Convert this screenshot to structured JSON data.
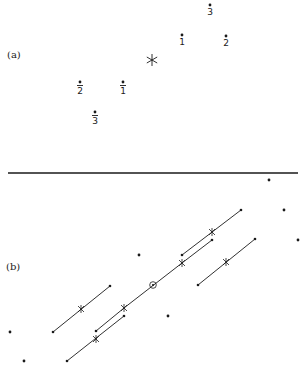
{
  "figure": {
    "panels": [
      {
        "label": "(a)",
        "label_pos": [
          7,
          57
        ],
        "center_marker": {
          "symbol": "asterisk",
          "pos": [
            152,
            60
          ]
        },
        "points": [
          {
            "label": "1",
            "bar": false,
            "pos": [
              182,
              40
            ]
          },
          {
            "label": "2",
            "bar": false,
            "pos": [
              226,
              41
            ]
          },
          {
            "label": "3",
            "bar": false,
            "pos": [
              210,
              10
            ]
          },
          {
            "label": "1",
            "bar": true,
            "pos": [
              123,
              88
            ]
          },
          {
            "label": "2",
            "bar": true,
            "pos": [
              80,
              88
            ]
          },
          {
            "label": "3",
            "bar": true,
            "pos": [
              95,
              118
            ]
          }
        ]
      },
      {
        "label": "(b)",
        "label_pos": [
          6,
          269
        ],
        "center_marker": {
          "symbol": "circled-dot",
          "pos": [
            153,
            285
          ]
        },
        "isolated_points": [
          [
            269,
            180
          ],
          [
            284,
            210
          ],
          [
            298,
            240
          ],
          [
            139,
            255
          ],
          [
            168,
            316
          ],
          [
            10,
            332
          ],
          [
            24,
            361
          ]
        ],
        "segments": [
          {
            "name": "main-line",
            "from": [
              124,
              308
            ],
            "to": [
              182,
              263
            ],
            "ends": "crosses"
          },
          {
            "name": "upper-branch",
            "from": [
              182,
              263
            ],
            "to": [
              212,
              240
            ],
            "end_dot": true
          },
          {
            "name": "lower-branch",
            "from": [
              124,
              308
            ],
            "to": [
              96,
              331
            ],
            "end_dot": true
          },
          {
            "name": "upper-pair-line",
            "from": [
              182,
              255
            ],
            "to": [
              241,
              210
            ],
            "cross": [
              212,
              232
            ]
          },
          {
            "name": "lower-pair-line",
            "from": [
              67,
              361
            ],
            "to": [
              124,
              316
            ],
            "cross": [
              96,
              339
            ]
          },
          {
            "name": "right-line",
            "from": [
              198,
              285
            ],
            "to": [
              255,
              239
            ],
            "cross": [
              226,
              262
            ]
          },
          {
            "name": "left-line",
            "from": [
              53,
              332
            ],
            "to": [
              110,
              286
            ],
            "cross": [
              81,
              309
            ]
          }
        ]
      }
    ],
    "divider": {
      "y": 173,
      "x1": 8,
      "x2": 298
    }
  },
  "labels": {
    "panel_a": "(a)",
    "panel_b": "(b)",
    "p1": "1",
    "p2": "2",
    "p3": "3",
    "p1bar": "1",
    "p2bar": "2",
    "p3bar": "3",
    "asterisk": "*"
  }
}
